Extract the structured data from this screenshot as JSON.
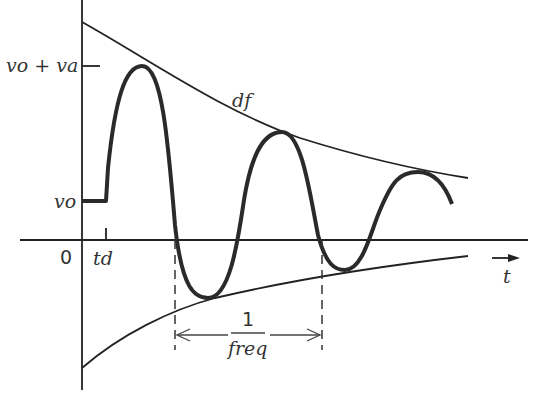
{
  "diagram": {
    "type": "damped-sine-waveform",
    "labels": {
      "peak": "vo + va",
      "offset": "vo",
      "origin": "0",
      "delay": "td",
      "damping": "df",
      "time_axis": "t",
      "period_numerator": "1",
      "period_denominator": "freq"
    },
    "colors": {
      "background": "#ffffff",
      "stroke": "#222222",
      "text": "#333333"
    }
  }
}
